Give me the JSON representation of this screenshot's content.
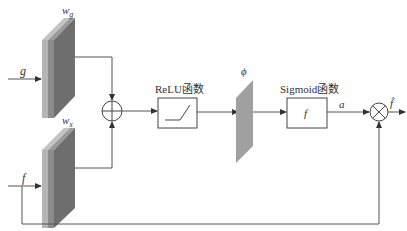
{
  "diagram": {
    "type": "attention-gate-block-diagram",
    "inputs": {
      "g": {
        "label": "g"
      },
      "f": {
        "label": "f"
      }
    },
    "weights": {
      "wg": {
        "label": "w",
        "subscript": "g"
      },
      "wx": {
        "label": "w",
        "subscript": "x"
      }
    },
    "nodes": {
      "sum": {
        "symbol": "plus-circle"
      },
      "relu": {
        "title": "ReLU函数"
      },
      "phi": {
        "label": "ϕ"
      },
      "sigmoid": {
        "title": "Sigmoid函数",
        "inner_label": "f"
      },
      "multiply": {
        "symbol": "times-circle"
      }
    },
    "edges": {
      "sigmoid_out": {
        "label": "a"
      },
      "output": {
        "label": "f̂"
      }
    },
    "colors": {
      "line": "#555555",
      "block_light": "#b8b8b8",
      "block_mid": "#8e8e8e",
      "block_dark": "#6f6f6f",
      "phi_fill": "#a0a0a0"
    }
  }
}
